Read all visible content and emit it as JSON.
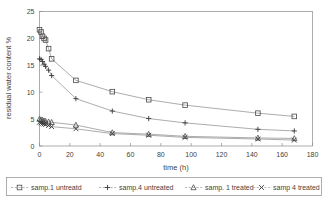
{
  "chart_data": {
    "type": "line",
    "title": "",
    "xlabel": "time (h)",
    "ylabel": "residual water content %",
    "xlim": [
      0,
      180
    ],
    "ylim": [
      0,
      25
    ],
    "xticks": [
      0,
      20,
      40,
      60,
      80,
      100,
      120,
      140,
      160,
      180
    ],
    "yticks": [
      0,
      5,
      10,
      15,
      20,
      25
    ],
    "grid": false,
    "legend_position": "bottom",
    "series": [
      {
        "name": "samp.1 untreatd",
        "marker": "square",
        "x": [
          0,
          1,
          2,
          3,
          4,
          6,
          8,
          24,
          48,
          72,
          96,
          144,
          168
        ],
        "y": [
          21.6,
          21.2,
          20.4,
          20.0,
          19.7,
          18.1,
          16.2,
          12.2,
          10.1,
          8.6,
          7.6,
          6.1,
          5.5
        ]
      },
      {
        "name": "samp.4 untreated",
        "marker": "plus",
        "x": [
          0,
          1,
          2,
          3,
          4,
          6,
          8,
          24,
          48,
          72,
          96,
          144,
          168
        ],
        "y": [
          16.2,
          16.1,
          15.7,
          15.2,
          14.8,
          14.1,
          13.1,
          8.8,
          6.5,
          5.1,
          4.3,
          3.1,
          2.8
        ]
      },
      {
        "name": "samp. 1 treated",
        "marker": "triangle",
        "x": [
          0,
          1,
          2,
          3,
          4,
          6,
          8,
          24,
          48,
          72,
          96,
          144,
          168
        ],
        "y": [
          5.0,
          4.9,
          4.8,
          4.7,
          4.6,
          4.5,
          4.4,
          3.9,
          2.5,
          2.2,
          1.8,
          1.5,
          1.4
        ]
      },
      {
        "name": "samp 4 treated",
        "marker": "cross",
        "x": [
          0,
          1,
          2,
          3,
          4,
          6,
          8,
          24,
          48,
          72,
          96,
          144,
          168
        ],
        "y": [
          4.4,
          4.3,
          4.2,
          4.1,
          4.0,
          3.8,
          3.6,
          3.2,
          2.3,
          2.0,
          1.6,
          1.3,
          1.1
        ]
      }
    ]
  },
  "legend": {
    "entries": [
      {
        "label": "samp.1 untreatd",
        "marker": "square"
      },
      {
        "label": "samp.4 untreated",
        "marker": "plus"
      },
      {
        "label": "samp. 1 treated",
        "marker": "triangle"
      },
      {
        "label": "samp 4 treated",
        "marker": "cross"
      }
    ]
  },
  "colors": {
    "axis": "#8c8c8c",
    "frame": "#9a9a9a",
    "line": "#888888",
    "marker": "#4a4a4a",
    "text": "#3f3f3f",
    "background": "#ffffff"
  }
}
